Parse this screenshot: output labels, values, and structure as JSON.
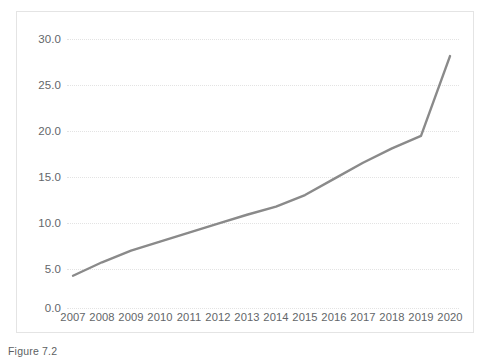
{
  "figure": {
    "caption": "Figure 7.2"
  },
  "chart_data": {
    "type": "line",
    "title": "",
    "xlabel": "",
    "ylabel": "",
    "x": [
      2007,
      2008,
      2009,
      2010,
      2011,
      2012,
      2013,
      2014,
      2015,
      2016,
      2017,
      2018,
      2019,
      2020
    ],
    "categories": [
      "2007",
      "2008",
      "2009",
      "2010",
      "2011",
      "2012",
      "2013",
      "2014",
      "2015",
      "2016",
      "2017",
      "2018",
      "2019",
      "2020"
    ],
    "values": [
      3.6,
      5.1,
      6.4,
      7.4,
      8.4,
      9.4,
      10.4,
      11.3,
      12.6,
      14.4,
      16.2,
      17.8,
      19.2,
      28.1
    ],
    "series": [
      {
        "name": "series-1",
        "color": "#8a8a8a",
        "values": [
          3.6,
          5.1,
          6.4,
          7.4,
          8.4,
          9.4,
          10.4,
          11.3,
          12.6,
          14.4,
          16.2,
          17.8,
          19.2,
          28.1
        ]
      }
    ],
    "ylim": [
      0.0,
      30.0
    ],
    "yticks": [
      0.0,
      5.0,
      10.0,
      15.0,
      20.0,
      25.0,
      30.0
    ],
    "ytick_labels": [
      "0.0",
      "5.0",
      "10.0",
      "15.0",
      "20.0",
      "25.0",
      "30.0"
    ],
    "xlim": [
      2007,
      2020
    ],
    "xtick_labels": [
      "2007",
      "2008",
      "2009",
      "2010",
      "2011",
      "2012",
      "2013",
      "2014",
      "2015",
      "2016",
      "2017",
      "2018",
      "2019",
      "2020"
    ],
    "grid": "horizontal-dotted",
    "legend": "none",
    "markers": "none",
    "line_color": "#8a8a8a",
    "line_width": 2.4,
    "grid_color": "#e3e3e3",
    "frame_color": "#e4e4e4",
    "tick_label_color": "#63666a"
  }
}
